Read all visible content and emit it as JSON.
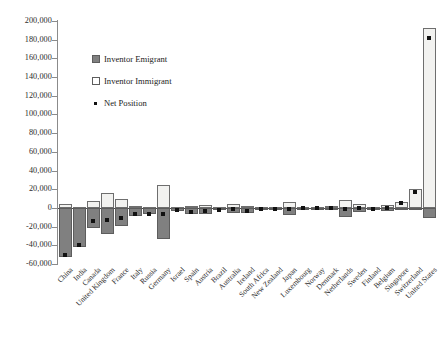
{
  "chart_data": {
    "type": "bar",
    "title": "",
    "subtitle": "",
    "xlabel": "",
    "ylabel": "",
    "ylim": [
      -60000,
      200000
    ],
    "ytick_step": 20000,
    "grid": false,
    "legend_position": "upper-left-inside",
    "yticks": [
      "200,000",
      "180,000",
      "160,000",
      "140,000",
      "120,000",
      "100,000",
      "80,000",
      "60,000",
      "40,000",
      "20,000",
      "0",
      "-20,000",
      "-40,000",
      "-60,000"
    ],
    "ytick_values": [
      200000,
      180000,
      160000,
      140000,
      120000,
      100000,
      80000,
      60000,
      40000,
      20000,
      0,
      -20000,
      -40000,
      -60000
    ],
    "categories": [
      "China",
      "India",
      "Canada",
      "United Kingdom",
      "France",
      "Italy",
      "Russia",
      "Germany",
      "Israel",
      "Spain",
      "Austria",
      "Brazil",
      "Australia",
      "Ireland",
      "South Africa",
      "New Zealand",
      "Japan",
      "Luxembourg",
      "Norway",
      "Denmark",
      "Netherlands",
      "Sweden",
      "Finland",
      "Belgium",
      "Singapore",
      "Switzerland",
      "United States"
    ],
    "series": [
      {
        "name": "Inventor Emigrant",
        "color": "#808080",
        "values": [
          -53000,
          -42000,
          -22000,
          -28000,
          -19000,
          -9000,
          -7000,
          -33000,
          -3000,
          -6000,
          -6000,
          -2500,
          -5000,
          -5000,
          -2000,
          -1500,
          -7500,
          -900,
          -1200,
          -2000,
          -9500,
          -4500,
          -2500,
          -3500,
          -2500,
          -2000,
          -11000
        ]
      },
      {
        "name": "Inventor Immigrant",
        "color": "#f2f2f0",
        "values": [
          4000,
          1500,
          7500,
          16000,
          9500,
          2500,
          1000,
          25000,
          500,
          2000,
          3000,
          800,
          4000,
          2500,
          900,
          700,
          6000,
          500,
          700,
          1800,
          9000,
          4000,
          1500,
          3000,
          6000,
          20000,
          193000
        ]
      }
    ],
    "net_position": {
      "name": "Net Position",
      "color": "#111111",
      "values": [
        -50000,
        -40000,
        -14500,
        -12500,
        -10500,
        -6500,
        -6000,
        -7000,
        -2500,
        -4000,
        -3000,
        -1800,
        -1500,
        -3000,
        -1200,
        -900,
        -1500,
        -500,
        -500,
        -300,
        -1000,
        -500,
        -1000,
        -500,
        5500,
        17000,
        182000
      ]
    },
    "legend_entries": [
      {
        "label": "Inventor Emigrant",
        "type": "swatch-filled"
      },
      {
        "label": "Inventor Immigrant",
        "type": "swatch-outline"
      },
      {
        "label": "Net Position",
        "type": "dot"
      }
    ]
  }
}
